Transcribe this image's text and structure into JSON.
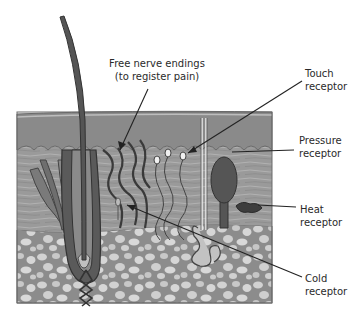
{
  "diagram": {
    "labels": {
      "free_nerve": {
        "line1": "Free nerve endings",
        "line2": "(to register pain)"
      },
      "touch": {
        "line1": "Touch",
        "line2": "receptor"
      },
      "pressure": {
        "line1": "Pressure",
        "line2": "receptor"
      },
      "heat": {
        "line1": "Heat",
        "line2": "receptor"
      },
      "cold": {
        "line1": "Cold",
        "line2": "receptor"
      }
    },
    "colors": {
      "epidermis": "#8a8a8a",
      "dermis": "#9c9c9c",
      "subcutaneous": "#8e8e8e",
      "fat_cells": "#d4d4d4",
      "nerve": "#3a3a3a",
      "pressure_bulb": "#555555",
      "line": "#222222"
    }
  }
}
